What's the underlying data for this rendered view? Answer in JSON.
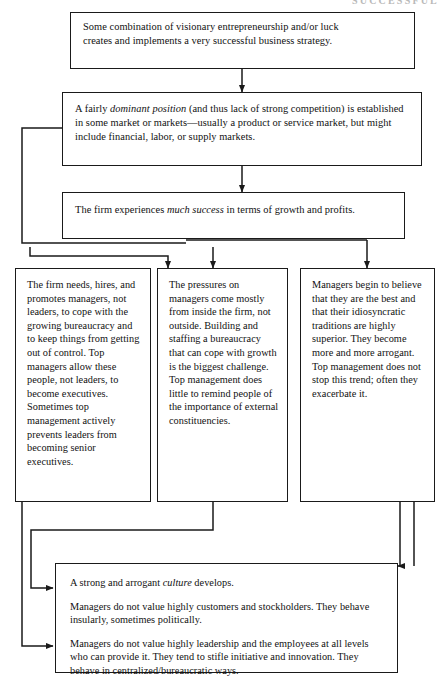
{
  "figure": {
    "type": "flowchart",
    "title_fragment": "SUCCESSFUL",
    "orientation": "top-to-bottom",
    "node_count": 7,
    "colors": {
      "stroke": "#1a1a1a",
      "background": "#ffffff",
      "text": "#111111"
    }
  },
  "nodes": {
    "box1": {
      "id": "successful-strategy",
      "line1": "Some combination of visionary entrepreneurship and/or luck",
      "line2": "creates and implements a very successful business strategy."
    },
    "box2": {
      "id": "dominant-position",
      "seg1": "A fairly ",
      "em1": "dominant position",
      "seg2": " (and thus lack of strong competition) is established in some market or markets—usually a product or service market, but might include financial, labor, or supply markets."
    },
    "box3": {
      "id": "much-success",
      "seg1": "The firm experiences ",
      "em1": "much success",
      "seg2": " in terms of growth and profits."
    },
    "col_left": {
      "id": "managers-not-leaders",
      "text": "The firm needs, hires, and promotes  managers, not leaders, to cope with the growing bureaucracy and to keep things from getting out of control.  Top managers allow these people, not leaders, to become executives.  Sometimes top management actively prevents leaders from becoming senior executives."
    },
    "col_mid": {
      "id": "internal-pressures",
      "text": "The pressures on managers come mostly from inside the firm, not outside. Building and staffing a bureaucracy that can cope with growth is the biggest challenge. Top management does little to remind people of the importance of external constituencies."
    },
    "col_right": {
      "id": "arrogance",
      "text": "Managers begin to believe that they are the best and that their idiosyncratic traditions are highly superior. They become more and more arrogant. Top management does not stop this trend; often they exacerbate it."
    },
    "box_bottom": {
      "id": "arrogant-culture",
      "p1_seg1": "A strong and arrogant ",
      "p1_em": "culture",
      "p1_seg2": " develops.",
      "p2": "Managers do not value highly customers and stockholders.  They behave insularly, sometimes politically.",
      "p3": "Managers do not value highly leadership and the employees at all levels who can provide it.  They tend to stifle initiative and innovation.  They behave in centralized/bureaucratic ways."
    }
  },
  "edges": [
    {
      "from": "box1",
      "to": "box2",
      "style": "straight-down-arrow"
    },
    {
      "from": "box2",
      "to": "box3",
      "style": "straight-down-arrow"
    },
    {
      "from": "box2",
      "to": "col_left",
      "style": "left-bus-elbow-arrow"
    },
    {
      "from": "box3",
      "to": "col_mid",
      "style": "straight-down-arrow"
    },
    {
      "from": "box3",
      "to": "col_left",
      "style": "elbow-down-arrow"
    },
    {
      "from": "box3",
      "to": "col_right",
      "style": "right-bus-elbow-arrow"
    },
    {
      "from": "col_mid",
      "to": "box_bottom",
      "style": "left-elbow-arrow"
    },
    {
      "from": "col_left",
      "to": "box_bottom",
      "style": "left-elbow-arrow"
    },
    {
      "from": "col_right",
      "to": "box_bottom",
      "style": "right-elbow-arrow"
    }
  ]
}
